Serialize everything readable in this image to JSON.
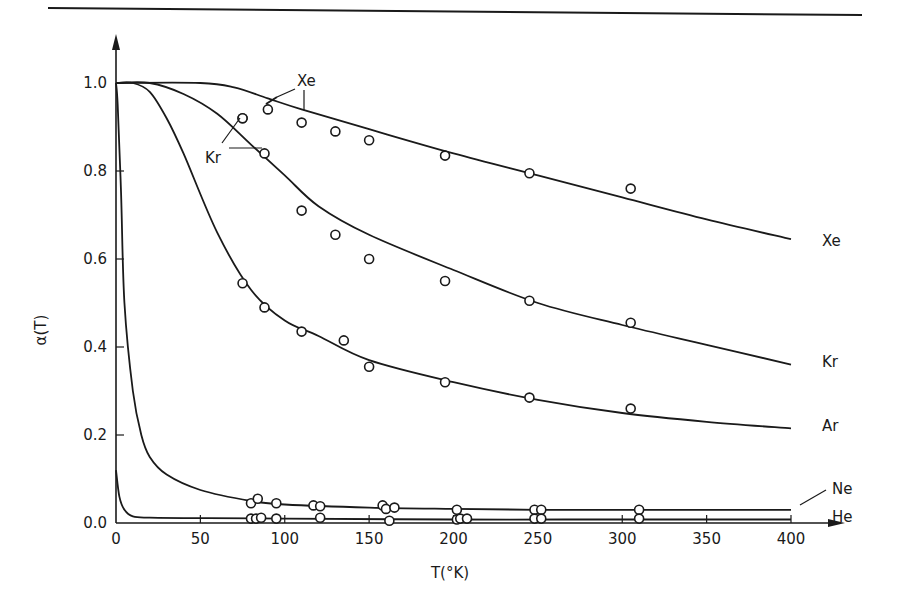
{
  "chart_data": {
    "type": "line",
    "title": "",
    "xlabel": "T(°K)",
    "ylabel": "α(T)",
    "xlim": [
      0,
      400
    ],
    "ylim": [
      0.0,
      1.0
    ],
    "x_ticks": [
      "0",
      "50",
      "100",
      "150",
      "200",
      "250",
      "300",
      "350",
      "400"
    ],
    "y_ticks": [
      "0.0",
      "0.2",
      "0.4",
      "0.6",
      "0.8",
      "1.0"
    ],
    "grid": false,
    "legend": "inline labels at curve ends",
    "series": [
      {
        "name": "Xe",
        "curve": [
          [
            0,
            1.0
          ],
          [
            50,
            1.0
          ],
          [
            70,
            0.99
          ],
          [
            90,
            0.965
          ],
          [
            110,
            0.94
          ],
          [
            150,
            0.895
          ],
          [
            200,
            0.84
          ],
          [
            250,
            0.79
          ],
          [
            300,
            0.74
          ],
          [
            350,
            0.69
          ],
          [
            400,
            0.645
          ]
        ],
        "points": [
          [
            75,
            0.92
          ],
          [
            90,
            0.94
          ],
          [
            110,
            0.91
          ],
          [
            130,
            0.89
          ],
          [
            150,
            0.87
          ],
          [
            195,
            0.835
          ],
          [
            245,
            0.795
          ],
          [
            305,
            0.76
          ]
        ]
      },
      {
        "name": "Kr",
        "curve": [
          [
            0,
            1.0
          ],
          [
            20,
            1.0
          ],
          [
            40,
            0.975
          ],
          [
            60,
            0.93
          ],
          [
            80,
            0.86
          ],
          [
            100,
            0.79
          ],
          [
            120,
            0.72
          ],
          [
            150,
            0.655
          ],
          [
            200,
            0.575
          ],
          [
            250,
            0.5
          ],
          [
            300,
            0.45
          ],
          [
            350,
            0.405
          ],
          [
            400,
            0.36
          ]
        ],
        "points": [
          [
            75,
            0.92
          ],
          [
            88,
            0.84
          ],
          [
            110,
            0.71
          ],
          [
            130,
            0.655
          ],
          [
            150,
            0.6
          ],
          [
            195,
            0.55
          ],
          [
            245,
            0.505
          ],
          [
            305,
            0.455
          ]
        ]
      },
      {
        "name": "Ar",
        "curve": [
          [
            0,
            1.0
          ],
          [
            10,
            1.0
          ],
          [
            20,
            0.98
          ],
          [
            30,
            0.92
          ],
          [
            40,
            0.84
          ],
          [
            60,
            0.66
          ],
          [
            80,
            0.53
          ],
          [
            100,
            0.46
          ],
          [
            120,
            0.425
          ],
          [
            150,
            0.37
          ],
          [
            200,
            0.32
          ],
          [
            250,
            0.28
          ],
          [
            300,
            0.25
          ],
          [
            350,
            0.23
          ],
          [
            400,
            0.215
          ]
        ],
        "points": [
          [
            75,
            0.545
          ],
          [
            88,
            0.49
          ],
          [
            110,
            0.435
          ],
          [
            135,
            0.415
          ],
          [
            150,
            0.355
          ],
          [
            195,
            0.32
          ],
          [
            245,
            0.285
          ],
          [
            305,
            0.26
          ]
        ]
      },
      {
        "name": "Ne",
        "curve": [
          [
            0,
            1.0
          ],
          [
            1,
            0.95
          ],
          [
            3,
            0.75
          ],
          [
            5,
            0.5
          ],
          [
            10,
            0.3
          ],
          [
            15,
            0.2
          ],
          [
            20,
            0.15
          ],
          [
            30,
            0.11
          ],
          [
            50,
            0.075
          ],
          [
            80,
            0.05
          ],
          [
            100,
            0.042
          ],
          [
            150,
            0.035
          ],
          [
            200,
            0.032
          ],
          [
            250,
            0.03
          ],
          [
            300,
            0.03
          ],
          [
            400,
            0.03
          ]
        ],
        "points": [
          [
            80,
            0.045
          ],
          [
            84,
            0.055
          ],
          [
            95,
            0.045
          ],
          [
            117,
            0.04
          ],
          [
            121,
            0.038
          ],
          [
            158,
            0.04
          ],
          [
            160,
            0.032
          ],
          [
            165,
            0.035
          ],
          [
            202,
            0.03
          ],
          [
            248,
            0.03
          ],
          [
            252,
            0.03
          ],
          [
            310,
            0.03
          ]
        ]
      },
      {
        "name": "He",
        "curve": [
          [
            0,
            0.12
          ],
          [
            2,
            0.06
          ],
          [
            5,
            0.03
          ],
          [
            10,
            0.015
          ],
          [
            20,
            0.012
          ],
          [
            50,
            0.011
          ],
          [
            100,
            0.01
          ],
          [
            200,
            0.008
          ],
          [
            300,
            0.008
          ],
          [
            400,
            0.008
          ]
        ],
        "points": [
          [
            80,
            0.01
          ],
          [
            83,
            0.01
          ],
          [
            86,
            0.012
          ],
          [
            95,
            0.01
          ],
          [
            121,
            0.012
          ],
          [
            162,
            0.005
          ],
          [
            202,
            0.008
          ],
          [
            204,
            0.01
          ],
          [
            208,
            0.01
          ],
          [
            248,
            0.01
          ],
          [
            252,
            0.01
          ],
          [
            310,
            0.01
          ]
        ]
      }
    ],
    "annotations": [
      {
        "text": "Xe",
        "note": "label with two leader arrows to Xe curve near T≈80–110"
      },
      {
        "text": "Kr",
        "note": "label with two leader arrows to Kr curve near T≈75–90"
      },
      {
        "text": "Ne",
        "note": "label with arrow pointing to Ne curve at T≈395"
      }
    ]
  }
}
